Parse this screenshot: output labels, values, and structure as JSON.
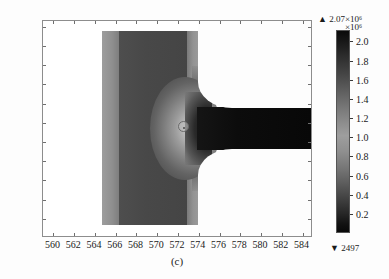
{
  "figure": {
    "caption": "(c)",
    "type": "contour-field-plot"
  },
  "chart_data": {
    "type": "heatmap",
    "title": "(c)",
    "xlabel": "",
    "ylabel": "",
    "xlim": [
      559.0,
      585.0
    ],
    "ylim": [
      1854.0,
      1876.6
    ],
    "xticks": [
      560,
      562,
      564,
      566,
      568,
      570,
      572,
      574,
      576,
      578,
      580,
      582,
      584
    ],
    "yticks": [
      1856,
      1858,
      1860,
      1862,
      1864,
      1866,
      1868,
      1870,
      1872,
      1874,
      1876
    ],
    "grid": false,
    "colormap": "grayscale",
    "colorbar": {
      "position": "right",
      "exponent_label": "×10⁶",
      "max_marker": "▲ 2.07×10⁶",
      "max_value": 2070000,
      "min_marker": "▼ 2497",
      "min_value": 2497,
      "ticks": [
        0.2,
        0.4,
        0.6,
        0.8,
        1.0,
        1.2,
        1.4,
        1.6,
        1.8,
        2.0
      ],
      "tick_labels": [
        "0.2",
        "0.4",
        "0.6",
        "0.8",
        "1.0",
        "1.2",
        "1.4",
        "1.6",
        "1.8",
        "2.0"
      ],
      "scale": 1000000
    },
    "annotations": [
      {
        "name": "probe-marker",
        "shape": "circle",
        "x": 572.4,
        "y": 1864.6
      }
    ],
    "regions": [
      {
        "name": "inlet-chamber",
        "x_range": [
          562.8,
          572.4
        ],
        "y_range": [
          1855.1,
          1874.9
        ]
      },
      {
        "name": "converging-throat",
        "x_range": [
          572.4,
          575.0
        ],
        "y_range": [
          1862.5,
          1866.6
        ]
      },
      {
        "name": "outlet-channel",
        "x_range": [
          574.5,
          582.0
        ],
        "y_range": [
          1862.0,
          1866.8
        ]
      }
    ]
  },
  "axes": {
    "x_tick_labels": [
      "560",
      "562",
      "564",
      "566",
      "568",
      "570",
      "572",
      "574",
      "576",
      "578",
      "580",
      "582",
      "584"
    ],
    "y_tick_labels": [
      "1876",
      "1874",
      "1872",
      "1870",
      "1868",
      "1866",
      "1864",
      "1862",
      "1860",
      "1858",
      "1856"
    ]
  },
  "colors": {
    "frame": "#8d8d8d",
    "background": "#ffffff",
    "text": "#1a1a1a",
    "colorbar_dark": "#080808",
    "colorbar_light": "#9e9e9e"
  }
}
